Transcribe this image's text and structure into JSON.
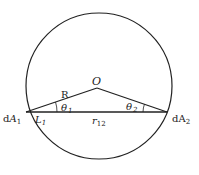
{
  "diagram": {
    "labels": {
      "center": "O",
      "radius": "R",
      "theta1": "θ",
      "theta1_sub": "1",
      "theta2": "θ",
      "theta2_sub": "2",
      "dA1": "dA",
      "dA1_sub": "1",
      "dA2": "dA",
      "dA2_sub": "2",
      "L1": "L",
      "L1_sub": "1",
      "r12": "r",
      "r12_sub": "12"
    },
    "colors": {
      "stroke": "#222222",
      "background": "#ffffff"
    }
  }
}
